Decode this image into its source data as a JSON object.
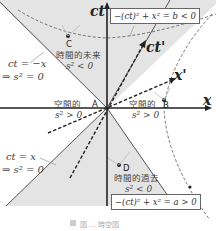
{
  "axes": {
    "vertical": "ct",
    "horizontal": "x",
    "vertical_prime": "ct'",
    "horizontal_prime": "x'"
  },
  "points": {
    "A": "A",
    "B": "B",
    "C": "C",
    "D": "D"
  },
  "regions": {
    "future": {
      "line1": "時間的未来",
      "line2": "s² < 0"
    },
    "past": {
      "line1": "時間的過去",
      "line2": "s² < 0"
    },
    "space_left": {
      "line1": "空間的",
      "line2": "s² > 0"
    },
    "space_right": {
      "line1": "空間的",
      "line2": "s² > 0"
    }
  },
  "light_lines": {
    "upper_left": {
      "line1": "ct = −x",
      "line2": "⇒ s² = 0"
    },
    "lower_left": {
      "line1": "ct = x",
      "line2": "⇒ s² = 0"
    }
  },
  "hyperbolas": {
    "timelike": "−(ct)² + x² = b < 0",
    "spacelike": "−(ct)² + x² = a > 0"
  },
  "caption": "図 ... 時空図",
  "colors": {
    "shade": "#e4e4e4",
    "axis": "#222222",
    "line": "#555555"
  }
}
